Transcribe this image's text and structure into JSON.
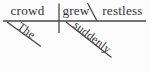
{
  "diagram": {
    "kind": "Reed-Kellogg sentence diagram",
    "subject": "crowd",
    "verb": "grew",
    "predicate_adjective": "restless",
    "subject_modifier": "The",
    "verb_modifier": "suddenly",
    "colors": {
      "line": "#474747",
      "text": "#343434",
      "background": "#fcfcfc"
    }
  }
}
